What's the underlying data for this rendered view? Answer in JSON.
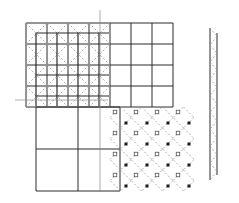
{
  "diagram": {
    "colors": {
      "background": "#ffffff",
      "solid_line": "#2a2a2a",
      "dashed_line": "#9a9a9a",
      "guide_line": "#8a8a8a",
      "marker_dark": "#1a1a1a",
      "marker_open": "#555555"
    },
    "upper_grid": {
      "x0": 26,
      "y0": 23,
      "cell": 21,
      "cols": 7,
      "rows": 4
    },
    "inner_grid": {
      "x0": 36,
      "y0": 33,
      "cell": 21,
      "cols": 3,
      "rows": 3
    },
    "lower_grid": {
      "x0": 36,
      "y0": 107,
      "cell": 42,
      "cols": 2,
      "rows": 2
    },
    "lattice": {
      "x0": 110,
      "y0": 107,
      "cell": 21,
      "cols": 4,
      "rows": 4
    },
    "guides": {
      "vertical_x": 100,
      "horizontal_y": 100
    },
    "strip": {
      "x_left": 210,
      "x_right": 217,
      "y_top": 28,
      "y_bottom": 180,
      "zigzags": 9
    }
  }
}
